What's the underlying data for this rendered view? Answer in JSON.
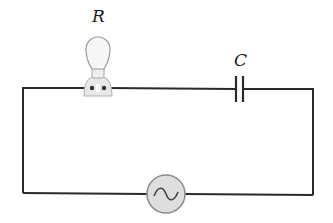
{
  "diagram": {
    "type": "series RC circuit with AC source",
    "components": [
      {
        "id": "R",
        "label": "R",
        "kind": "light-bulb-resistor",
        "position": "top wire, left"
      },
      {
        "id": "C",
        "label": "C",
        "kind": "capacitor",
        "position": "top wire, right"
      },
      {
        "id": "source",
        "label": "",
        "kind": "ac-voltage-source",
        "symbol": "~",
        "position": "bottom wire, center"
      }
    ],
    "colors": {
      "wire": "#2a2a2a",
      "bulb_fill": "#f2f2f2",
      "bulb_stroke": "#9a9a9a",
      "source_fill": "#dedede",
      "source_stroke": "#8a8a8a"
    }
  }
}
